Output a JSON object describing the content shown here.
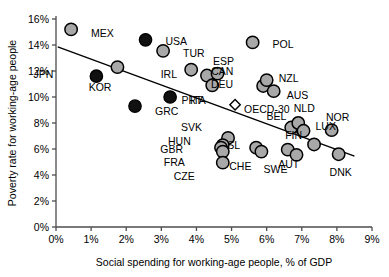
{
  "chart_data": {
    "type": "scatter",
    "title": "",
    "xlabel": "Social spending for working-age people, % of GDP",
    "ylabel": "Poverty rate for working-age people",
    "xlim": [
      0,
      9
    ],
    "ylim": [
      0,
      16
    ],
    "xticks": [
      "0%",
      "1%",
      "2%",
      "3%",
      "4%",
      "5%",
      "6%",
      "7%",
      "8%",
      "9%"
    ],
    "yticks": [
      "0%",
      "2%",
      "4%",
      "6%",
      "8%",
      "10%",
      "12%",
      "14%",
      "16%"
    ],
    "grid": false,
    "legend": "none",
    "marker_styles": {
      "open": "#a8a8a8",
      "filled": "#111111",
      "average": "#ffffff"
    },
    "trendline": {
      "x0": 0.05,
      "y0": 13.85,
      "x1": 8.5,
      "y1": 5.45
    },
    "points": [
      {
        "code": "MEX",
        "x": 0.43,
        "y": 15.2,
        "style": "open",
        "lx": 20,
        "ly": 4
      },
      {
        "code": "JPN",
        "x": 1.15,
        "y": 11.6,
        "style": "filled",
        "lx": -43,
        "ly": -2
      },
      {
        "code": "KOR",
        "x": 1.75,
        "y": 12.3,
        "style": "open",
        "lx": -6,
        "ly": 20
      },
      {
        "code": "USA",
        "x": 2.55,
        "y": 14.4,
        "style": "filled",
        "lx": 20,
        "ly": 2
      },
      {
        "code": "TUR",
        "x": 3.05,
        "y": 13.55,
        "style": "open",
        "lx": 20,
        "ly": 3
      },
      {
        "code": "GRC",
        "x": 2.25,
        "y": 9.3,
        "style": "filled",
        "lx": 20,
        "ly": 5
      },
      {
        "code": "ITA",
        "x": 3.25,
        "y": 10.0,
        "style": "filled",
        "lx": 20,
        "ly": 3
      },
      {
        "code": "CAN",
        "x": 3.85,
        "y": 12.1,
        "style": "open",
        "lx": 20,
        "ly": 2
      },
      {
        "code": "IRL",
        "x": 4.3,
        "y": 11.65,
        "style": "open",
        "lx": -30,
        "ly": -1
      },
      {
        "code": "ESP",
        "x": 4.6,
        "y": 11.8,
        "style": "open",
        "lx": 6,
        "ly": -12
      },
      {
        "code": "PRT",
        "x": 4.45,
        "y": 10.9,
        "style": "open",
        "lx": -10,
        "ly": 15
      },
      {
        "code": "DEU",
        "x": 5.9,
        "y": 10.85,
        "style": "open",
        "lx": -30,
        "ly": -2
      },
      {
        "code": "NZL",
        "x": 6.0,
        "y": 11.3,
        "style": "open",
        "lx": 12,
        "ly": -2
      },
      {
        "code": "AUS",
        "x": 6.2,
        "y": 10.45,
        "style": "open",
        "lx": 13,
        "ly": 4
      },
      {
        "code": "POL",
        "x": 5.6,
        "y": 14.2,
        "style": "open",
        "lx": 20,
        "ly": 2
      },
      {
        "code": "OECD-30",
        "x": 5.1,
        "y": 9.4,
        "style": "average",
        "lx": 9,
        "ly": 5
      },
      {
        "code": "SVK",
        "x": 4.9,
        "y": 6.85,
        "style": "open",
        "lx": -26,
        "ly": -11
      },
      {
        "code": "HUN",
        "x": 4.75,
        "y": 6.3,
        "style": "open",
        "lx": -32,
        "ly": -4
      },
      {
        "code": "GBR",
        "x": 4.7,
        "y": 6.1,
        "style": "open",
        "lx": -38,
        "ly": 2
      },
      {
        "code": "FRA",
        "x": 4.75,
        "y": 5.8,
        "style": "open",
        "lx": -38,
        "ly": 11
      },
      {
        "code": "CZE",
        "x": 4.75,
        "y": 4.95,
        "style": "open",
        "lx": -28,
        "ly": 14
      },
      {
        "code": "SL",
        "x": 5.7,
        "y": 6.1,
        "style": "open",
        "lx": -16,
        "ly": -2
      },
      {
        "code": "CHE",
        "x": 5.85,
        "y": 5.8,
        "style": "open",
        "lx": -10,
        "ly": 15
      },
      {
        "code": "AUT",
        "x": 6.6,
        "y": 5.95,
        "style": "open",
        "lx": 1,
        "ly": 15
      },
      {
        "code": "BEL",
        "x": 6.7,
        "y": 7.65,
        "style": "open",
        "lx": -5,
        "ly": -11
      },
      {
        "code": "NLD",
        "x": 6.9,
        "y": 8.0,
        "style": "open",
        "lx": 6,
        "ly": -15
      },
      {
        "code": "LUX",
        "x": 7.05,
        "y": 7.4,
        "style": "open",
        "lx": 12,
        "ly": -4
      },
      {
        "code": "NOR",
        "x": 7.85,
        "y": 7.45,
        "style": "open",
        "lx": 6,
        "ly": -13
      },
      {
        "code": "FIN",
        "x": 7.35,
        "y": 6.35,
        "style": "open",
        "lx": -12,
        "ly": -9
      },
      {
        "code": "SWE",
        "x": 6.85,
        "y": 5.55,
        "style": "open",
        "lx": -9,
        "ly": 15
      },
      {
        "code": "DNK",
        "x": 8.05,
        "y": 5.6,
        "style": "open",
        "lx": 2,
        "ly": 18
      }
    ]
  }
}
